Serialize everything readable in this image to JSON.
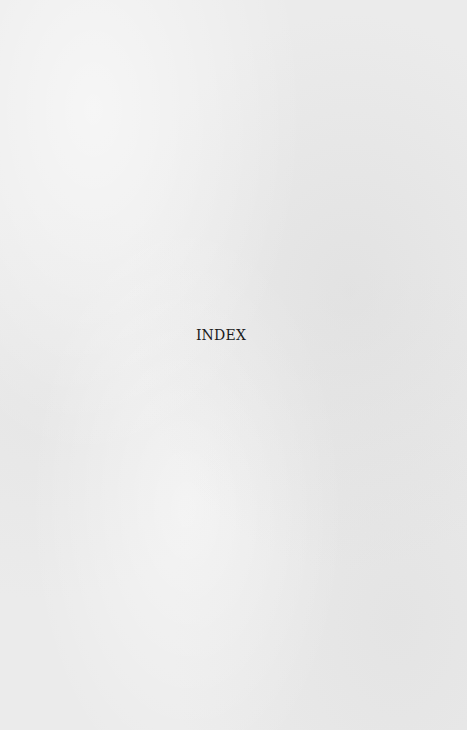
{
  "page": {
    "heading": "INDEX",
    "background_color": "#ebebeb",
    "text_color": "#1a1a1a"
  }
}
